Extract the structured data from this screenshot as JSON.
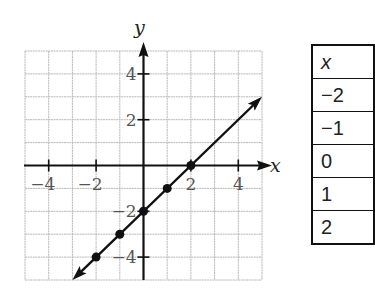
{
  "chart_data": {
    "type": "line",
    "title": "",
    "xlabel": "x",
    "ylabel": "y",
    "xlim": [
      -5,
      5
    ],
    "ylim": [
      -5,
      5
    ],
    "grid": true,
    "x_ticks": [
      -4,
      -2,
      2,
      4
    ],
    "y_ticks": [
      4,
      2,
      -2,
      -4
    ],
    "x_tick_labels": [
      "−4",
      "−2",
      "2",
      "4"
    ],
    "y_tick_labels": [
      "4",
      "2",
      "−2",
      "−4"
    ],
    "series": [
      {
        "name": "y = x − 2",
        "line_from": [
          -3,
          -5
        ],
        "line_to": [
          5,
          3
        ],
        "arrows": "both",
        "points": [
          [
            -2,
            -4
          ],
          [
            -1,
            -3
          ],
          [
            0,
            -2
          ],
          [
            1,
            -1
          ],
          [
            2,
            0
          ]
        ]
      }
    ]
  },
  "table": {
    "header": "x",
    "rows": [
      "−2",
      "−1",
      "0",
      "1",
      "2"
    ]
  },
  "colors": {
    "grid": "#b8b8b8",
    "axis": "#111111",
    "line": "#111111"
  }
}
